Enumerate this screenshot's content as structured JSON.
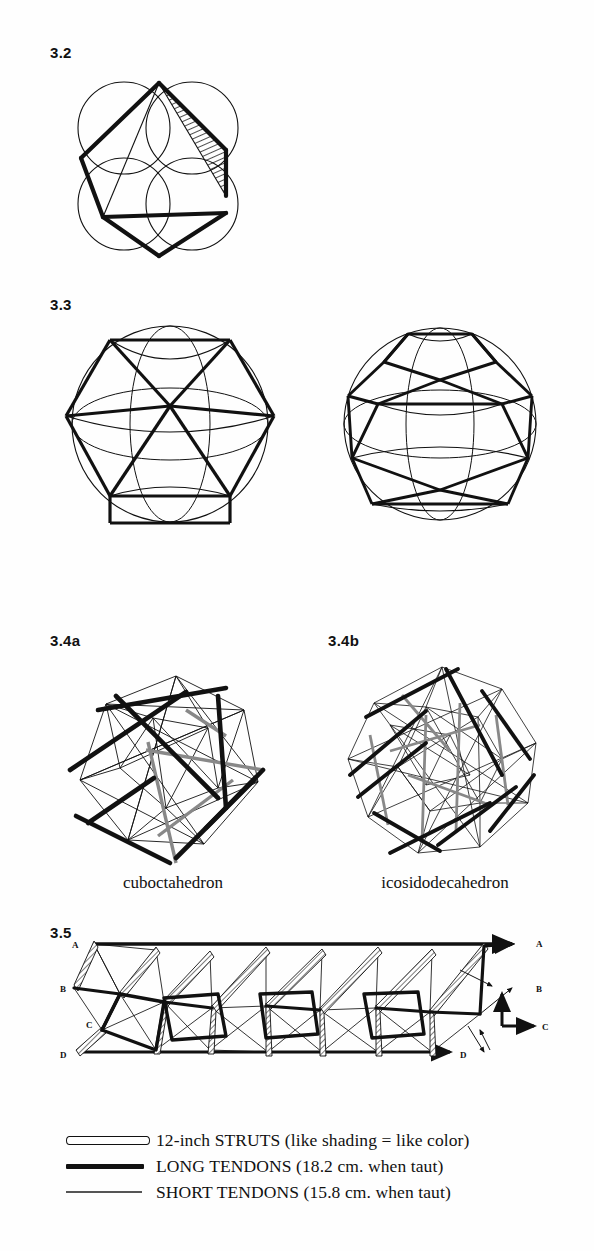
{
  "page": {
    "background": "#fefefe",
    "ink": "#111111"
  },
  "figures": [
    {
      "id": "3.2",
      "label": "3.2",
      "caption": "",
      "description": "Four overlapping circles with a heavy triangular strut framework and one hatched sliver region"
    },
    {
      "id": "3.3",
      "label": "3.3",
      "caption": "",
      "description": "Two spheres: cuboctahedral geodesic sphere (left) and icosidodecahedral geodesic sphere (right)"
    },
    {
      "id": "3.4a",
      "label": "3.4a",
      "caption": "cuboctahedron",
      "description": "Tensegrity cuboctahedron with 12-inch struts and tendon net"
    },
    {
      "id": "3.4b",
      "label": "3.4b",
      "caption": "icosidodecahedron",
      "description": "Tensegrity icosidodecahedron with 12-inch struts and tendon net"
    },
    {
      "id": "3.5",
      "label": "3.5",
      "caption": "",
      "description": "Unrolled planar net of the tensegrity with repeating square modules",
      "vertex_labels_left": [
        "A",
        "B",
        "C",
        "D"
      ],
      "vertex_labels_right": [
        "A",
        "B",
        "C",
        "D"
      ]
    }
  ],
  "legend": {
    "rows": [
      {
        "symbol": "open-bar",
        "text": "12-inch STRUTS (like shading = like color)"
      },
      {
        "symbol": "thick-bar",
        "text": "LONG TENDONS (18.2 cm. when taut)"
      },
      {
        "symbol": "thin-line",
        "text": "SHORT TENDONS (15.8 cm. when taut)"
      }
    ]
  }
}
